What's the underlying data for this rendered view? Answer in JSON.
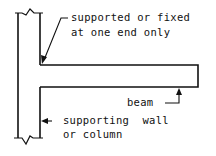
{
  "diagram": {
    "labels": {
      "fixed_line1": "supported or fixed",
      "fixed_line2": "at one end only",
      "beam": "beam",
      "support_line1": "supporting  wall",
      "support_line2": "or column"
    },
    "colors": {
      "line": "#111111",
      "background": "#ffffff"
    }
  }
}
